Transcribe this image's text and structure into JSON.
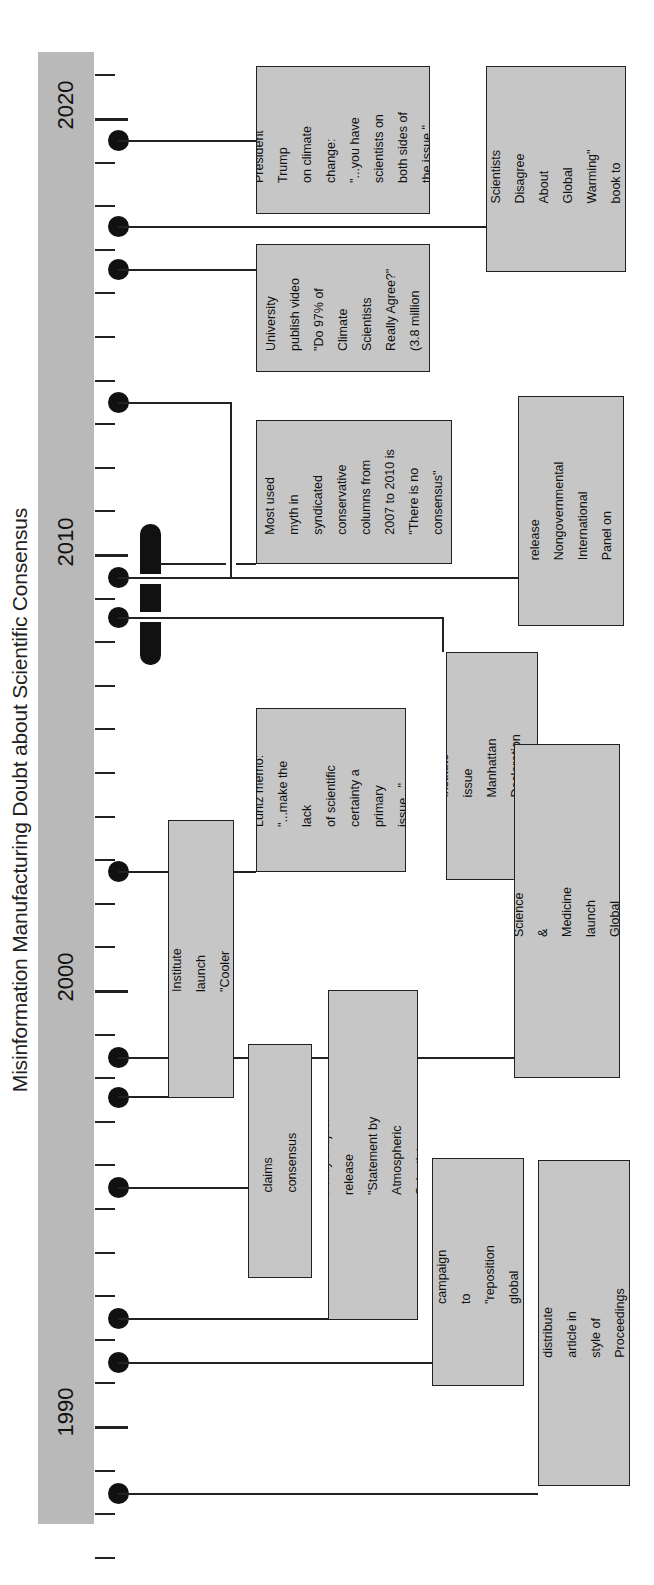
{
  "title": "Misinformation Manufacturing Doubt about Scientific Consensus",
  "axis": {
    "year_labels": [
      {
        "label": "2020",
        "y": 119
      },
      {
        "label": "2010",
        "y": 556
      },
      {
        "label": "2000",
        "y": 991
      },
      {
        "label": "1990",
        "y": 1426
      }
    ],
    "px_per_year": 43.6,
    "start_year": 1987,
    "end_year": 2021
  },
  "events": [
    {
      "id": "trump",
      "year": 2019.5,
      "text": "President Trump\non climate\nchange:\n\"...you have\nscientists on\nboth sides of\nthe issue.\""
    },
    {
      "id": "heartland-book",
      "year": 2017.5,
      "text": "Heartland Institute\nsend \"Why Scientists\nDisagree About Global\nWarming\" book to\n25,000 science\nteachers."
    },
    {
      "id": "prageru",
      "year": 2016.5,
      "text": "Prager University\npublish video\n\"Do 97% of\nClimate Scientists\nReally Agree?\"\n(3.8 million\nviews)"
    },
    {
      "id": "myth",
      "year_range": [
        2007,
        2010
      ],
      "text": "Most used\nmyth in\nsyndicated\nconservative\ncolumns from\n2007 to 2010 is\n\"There is no\nconsensus\""
    },
    {
      "id": "nipcc",
      "year": 2013.5,
      "text": "Heartland Institute\nrelease Nongovernmental\nInternational Panel on\nClimate Change Report"
    },
    {
      "id": "manhattan",
      "year": 2008.5,
      "text": "Heartland Institute issue\nManhattan Declaration\non Climate Change"
    },
    {
      "id": "luntz",
      "year": 2002.5,
      "text": "Luntz memo:\n\"...make the lack\nof scientific\ncertainty a\nprimary issue...\""
    },
    {
      "id": "cei",
      "year": 1997.5,
      "text": "Competitive Enterprise Institute\nlaunch \"Cooler Heads Coalition\""
    },
    {
      "id": "oregon-petition",
      "year": 1998.5,
      "text": "Oregon Institute of Science & Medicine\nlaunch Global Warming Petition Project"
    },
    {
      "id": "leipzig",
      "year": 1995.5,
      "text": "Leipzig Declaration claims\nconsensus doesn't exist"
    },
    {
      "id": "sepp",
      "year": 1992.5,
      "text": "Science & Environmental Policy Project\nrelease \"Statement by Atmospheric\nScientists on Greenhouse Warming\""
    },
    {
      "id": "western-fuels",
      "year": 1991.5,
      "text": "Western Fuels Association\ncampaign to \"reposition global\nwarming as theory (not fact)\""
    },
    {
      "id": "oregon-article",
      "year": 1988.5,
      "text": "Oregon Institute of Science & Medicine\ndistribute article in style of Proceedings\nof the National Academy of Science"
    }
  ],
  "colors": {
    "axis_bar": "#b9b9b9",
    "box_fill": "#c6c6c6",
    "line": "#222222",
    "dot": "#111111"
  }
}
